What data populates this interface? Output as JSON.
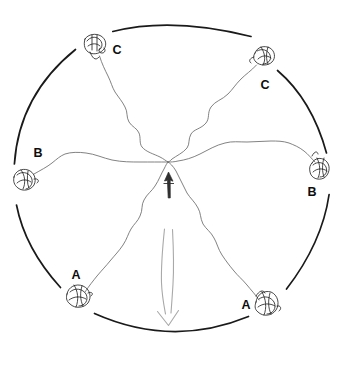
{
  "figure": {
    "name": "radial-arena-trace-diagram",
    "background_color": "#ffffff",
    "ink_color": "#1a1a1a",
    "trace_color": "#6e6e6e",
    "arrow_light_color": "#a8a8a8",
    "arrow_dark_color": "#2a2a2a",
    "arena": {
      "name": "arena-boundary-circle",
      "center_x": 172,
      "center_y": 178,
      "radius": 158,
      "stroke_width": 1.6,
      "gap_count": 6,
      "arc_segments": [
        {
          "id": "arc-top",
          "start_deg": -112,
          "end_deg": -60
        },
        {
          "id": "arc-upper-right",
          "start_deg": -48,
          "end_deg": -9
        },
        {
          "id": "arc-lower-right",
          "start_deg": 6,
          "end_deg": 47
        },
        {
          "id": "arc-bottom",
          "start_deg": 61,
          "end_deg": 114
        },
        {
          "id": "arc-lower-left",
          "start_deg": 128,
          "end_deg": 170
        },
        {
          "id": "arc-upper-left",
          "start_deg": -176,
          "end_deg": -128
        }
      ]
    },
    "convergence_point": {
      "name": "center-convergence-point",
      "x": 168,
      "y": 162
    },
    "stations": [
      {
        "id": "station-c-top-left",
        "label": "C",
        "label_x": 117,
        "label_y": 54,
        "knot_x": 94,
        "knot_y": 45,
        "knot_rx": 11,
        "knot_ry": 9,
        "angle_deg": -122
      },
      {
        "id": "station-c-top-right",
        "label": "C",
        "label_x": 265,
        "label_y": 89,
        "knot_x": 264,
        "knot_y": 57,
        "knot_rx": 10,
        "knot_ry": 9,
        "angle_deg": -56
      },
      {
        "id": "station-b-left",
        "label": "B",
        "label_x": 38,
        "label_y": 157,
        "knot_x": 24,
        "knot_y": 180,
        "knot_rx": 11,
        "knot_ry": 9,
        "angle_deg": 179
      },
      {
        "id": "station-b-right",
        "label": "B",
        "label_x": 312,
        "label_y": 196,
        "knot_x": 320,
        "knot_y": 170,
        "knot_rx": 9,
        "knot_ry": 9,
        "angle_deg": -5
      },
      {
        "id": "station-a-bottom-left",
        "label": "A",
        "label_x": 76,
        "label_y": 279,
        "knot_x": 77,
        "knot_y": 298,
        "knot_rx": 11,
        "knot_ry": 10,
        "angle_deg": 130
      },
      {
        "id": "station-a-bottom-right",
        "label": "A",
        "label_x": 246,
        "label_y": 309,
        "knot_x": 266,
        "knot_y": 307,
        "knot_rx": 10,
        "knot_ry": 11,
        "angle_deg": 56
      }
    ],
    "traces": [
      {
        "id": "trace-from-c-top-left",
        "from_station": "station-c-top-left",
        "to": "center-convergence-point"
      },
      {
        "id": "trace-from-c-top-right",
        "from_station": "station-c-top-right",
        "to": "center-convergence-point"
      },
      {
        "id": "trace-from-b-left",
        "from_station": "station-b-left",
        "to": "center-convergence-point"
      },
      {
        "id": "trace-from-b-right",
        "from_station": "station-b-right",
        "to": "center-convergence-point"
      },
      {
        "id": "trace-from-a-bottom-left",
        "from_station": "station-a-bottom-left",
        "to": "center-convergence-point"
      },
      {
        "id": "trace-from-a-bottom-right",
        "from_station": "station-a-bottom-right",
        "to": "center-convergence-point"
      }
    ],
    "arrows": [
      {
        "id": "arrow-up-short-dark",
        "direction": "up",
        "tip_x": 168,
        "tip_y": 171,
        "tail_x": 169,
        "tail_y": 198,
        "color": "#2a2a2a",
        "style": "solid-filled"
      },
      {
        "id": "arrow-down-long-light",
        "direction": "down",
        "tail_x": 170,
        "tail_y": 228,
        "tip_x": 168,
        "tip_y": 325,
        "color": "#a8a8a8",
        "style": "outline-open"
      }
    ]
  }
}
